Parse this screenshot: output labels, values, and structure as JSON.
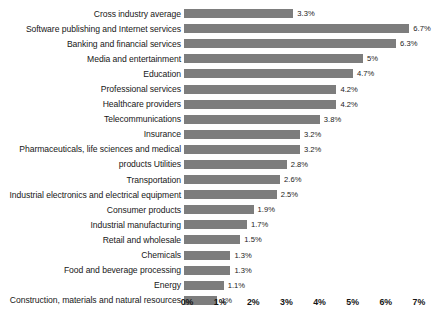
{
  "chart_data": {
    "type": "bar",
    "orientation": "horizontal",
    "title": "",
    "subtitle": "",
    "xlabel": "",
    "ylabel": "",
    "xlim": [
      0,
      7
    ],
    "grid": false,
    "legend": null,
    "bar_color": "#7d7d7d",
    "background_color": "#ffffff",
    "value_suffix": "%",
    "xticks": [
      "0%",
      "1%",
      "2%",
      "3%",
      "4%",
      "5%",
      "6%",
      "7%"
    ],
    "xtick_values": [
      0,
      1,
      2,
      3,
      4,
      5,
      6,
      7
    ],
    "categories": [
      "Cross industry average",
      "Software publishing and Internet services",
      "Banking and financial services",
      "Media  and  entertainment",
      "Education",
      "Professional services",
      "Healthcare providers",
      "Telecommunications",
      "Insurance",
      "Pharmaceuticals, life sciences  and  medical",
      "products Utilities",
      "Transportation",
      "Industrial electronics and electrical equipment",
      "Consumer products",
      "Industrial manufacturing",
      "Retail and wholesale",
      "Chemicals",
      "Food and beverage processing",
      "Energy",
      "Construction, materials and natural resources"
    ],
    "values": [
      3.3,
      6.7,
      6.3,
      5,
      4.7,
      4.2,
      4.2,
      3.8,
      3.2,
      3.2,
      2.8,
      2.6,
      2.5,
      1.9,
      1.7,
      1.5,
      1.3,
      1.3,
      1.1,
      1
    ],
    "value_labels": [
      "3.3%",
      "6.7%",
      "6.3%",
      "5%",
      "4.7%",
      "4.2%",
      "4.2%",
      "3.8%",
      "3.2%",
      "3.2%",
      "2.8%",
      "2.6%",
      "2.5%",
      "1.9%",
      "1.7%",
      "1.5%",
      "1.3%",
      "1.3%",
      "1.1%",
      "1%"
    ],
    "bar_draw_values": [
      3.3,
      6.8,
      6.4,
      5.4,
      5.1,
      4.6,
      4.6,
      4.1,
      3.5,
      3.5,
      3.1,
      2.9,
      2.8,
      2.1,
      1.9,
      1.7,
      1.4,
      1.4,
      1.2,
      1.0
    ],
    "rows": [
      {
        "label": "Cross industry average",
        "value": 3.3,
        "value_label": "3.3%",
        "bar_length": 3.3
      },
      {
        "label": "Software publishing and Internet services",
        "value": 6.7,
        "value_label": "6.7%",
        "bar_length": 6.8
      },
      {
        "label": "Banking and financial services",
        "value": 6.3,
        "value_label": "6.3%",
        "bar_length": 6.4
      },
      {
        "label": "Media  and  entertainment",
        "value": 5.0,
        "value_label": "5%",
        "bar_length": 5.4
      },
      {
        "label": "Education",
        "value": 4.7,
        "value_label": "4.7%",
        "bar_length": 5.1
      },
      {
        "label": "Professional services",
        "value": 4.2,
        "value_label": "4.2%",
        "bar_length": 4.6
      },
      {
        "label": "Healthcare providers",
        "value": 4.2,
        "value_label": "4.2%",
        "bar_length": 4.6
      },
      {
        "label": "Telecommunications",
        "value": 3.8,
        "value_label": "3.8%",
        "bar_length": 4.1
      },
      {
        "label": "Insurance",
        "value": 3.2,
        "value_label": "3.2%",
        "bar_length": 3.5
      },
      {
        "label": "Pharmaceuticals, life sciences  and  medical",
        "value": 3.2,
        "value_label": "3.2%",
        "bar_length": 3.5
      },
      {
        "label": "products Utilities",
        "value": 2.8,
        "value_label": "2.8%",
        "bar_length": 3.1
      },
      {
        "label": "Transportation",
        "value": 2.6,
        "value_label": "2.6%",
        "bar_length": 2.9
      },
      {
        "label": "Industrial electronics and electrical equipment",
        "value": 2.5,
        "value_label": "2.5%",
        "bar_length": 2.8
      },
      {
        "label": "Consumer products",
        "value": 1.9,
        "value_label": "1.9%",
        "bar_length": 2.1
      },
      {
        "label": "Industrial manufacturing",
        "value": 1.7,
        "value_label": "1.7%",
        "bar_length": 1.9
      },
      {
        "label": "Retail and wholesale",
        "value": 1.5,
        "value_label": "1.5%",
        "bar_length": 1.7
      },
      {
        "label": "Chemicals",
        "value": 1.3,
        "value_label": "1.3%",
        "bar_length": 1.4
      },
      {
        "label": "Food and beverage processing",
        "value": 1.3,
        "value_label": "1.3%",
        "bar_length": 1.4
      },
      {
        "label": "Energy",
        "value": 1.1,
        "value_label": "1.1%",
        "bar_length": 1.2
      },
      {
        "label": "Construction, materials and natural resources",
        "value": 1.0,
        "value_label": "1%",
        "bar_length": 1.0
      }
    ]
  }
}
